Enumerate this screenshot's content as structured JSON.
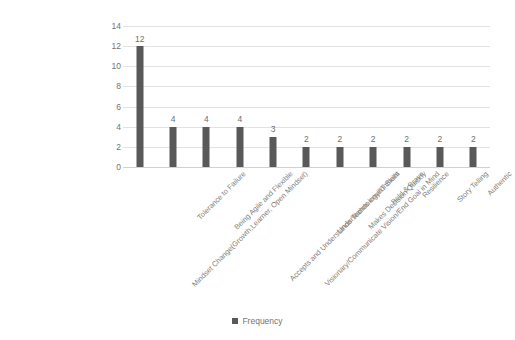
{
  "chart_data": {
    "type": "bar",
    "title": "",
    "xlabel": "",
    "ylabel": "",
    "ylim": [
      0,
      14
    ],
    "ytick_step": 2,
    "yticks": [
      "14",
      "12",
      "10",
      "8",
      "6",
      "4",
      "2",
      "0"
    ],
    "grid": true,
    "legend_position": "bottom",
    "series": [
      {
        "name": "Frequency",
        "color": "#595959",
        "values": [
          12,
          4,
          4,
          4,
          3,
          2,
          2,
          2,
          2,
          2,
          2
        ]
      }
    ],
    "categories": [
      "Mindset Change(Growth,Learner, Open Mindset)",
      "Tolerance to Failure",
      "Being Agile and Flexible",
      "Accepts and Understands Technology/IT Skills",
      "Visionary/Communicate Vision/End Goal in Mind",
      "Understands environment",
      "Makes Decision Quickly",
      "Bold & Brave",
      "Resilience",
      "Story Telling",
      "Authentic"
    ],
    "data_labels": [
      "12",
      "4",
      "4",
      "4",
      "3",
      "2",
      "2",
      "2",
      "2",
      "2",
      "2"
    ]
  },
  "legend": {
    "items": [
      {
        "label": "Frequency",
        "color": "#595959"
      }
    ]
  },
  "colors": {
    "bar": "#595959",
    "gridline": "#e2e2e2",
    "axis": "#d2d2d2",
    "text": "#737373",
    "background": "#ffffff"
  }
}
